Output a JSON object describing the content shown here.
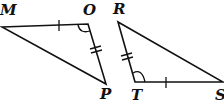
{
  "diagram": {
    "triangles": [
      {
        "name": "MOP",
        "vertices": [
          {
            "label": "M",
            "x": 2,
            "y": 27
          },
          {
            "label": "O",
            "x": 88,
            "y": 24
          },
          {
            "label": "P",
            "x": 106,
            "y": 84
          }
        ],
        "markings": {
          "single_tick_side": "MO",
          "double_tick_side": "OP",
          "angle_arc_vertex": "O"
        }
      },
      {
        "name": "RTS",
        "vertices": [
          {
            "label": "R",
            "x": 118,
            "y": 22
          },
          {
            "label": "T",
            "x": 135,
            "y": 82
          },
          {
            "label": "S",
            "x": 223,
            "y": 82
          }
        ],
        "markings": {
          "single_tick_side": "TS",
          "double_tick_side": "RT",
          "angle_arc_vertex": "T"
        }
      }
    ],
    "labels": {
      "M": "M",
      "O": "O",
      "P": "P",
      "R": "R",
      "T": "T",
      "S": "S"
    },
    "stroke_color": "#111111",
    "background": "#ffffff"
  }
}
